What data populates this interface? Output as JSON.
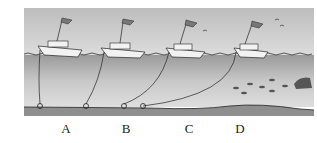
{
  "diagram": {
    "labels": [
      "A",
      "B",
      "C",
      "D"
    ],
    "colors": {
      "sky": "#cfcfcf",
      "water": "#a9a9a9",
      "seabed": "#8e8e8e",
      "line": "#222222"
    }
  }
}
